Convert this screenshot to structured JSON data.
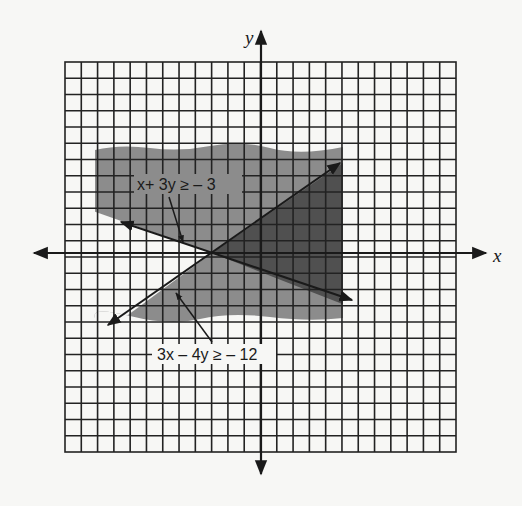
{
  "figure": {
    "axes": {
      "x_label": "x",
      "y_label": "y"
    },
    "grid": {
      "columns": 24,
      "rows": 24,
      "x_range": [
        -12,
        12
      ],
      "y_range": [
        -12,
        12
      ]
    },
    "inequalities": [
      {
        "id": "ineq1",
        "label": "x+ 3y ≥ – 3",
        "line": "x + 3y = -3"
      },
      {
        "id": "ineq2",
        "label": "3x – 4y ≥ – 12",
        "line": "3x - 4y = -12"
      }
    ],
    "intersection": {
      "x": -3,
      "y": 0
    },
    "colors": {
      "paper": "#f7f7f5",
      "grid_line": "#222222",
      "light_shade": "#8a8a8a",
      "dark_shade": "#4e4e4e"
    }
  }
}
